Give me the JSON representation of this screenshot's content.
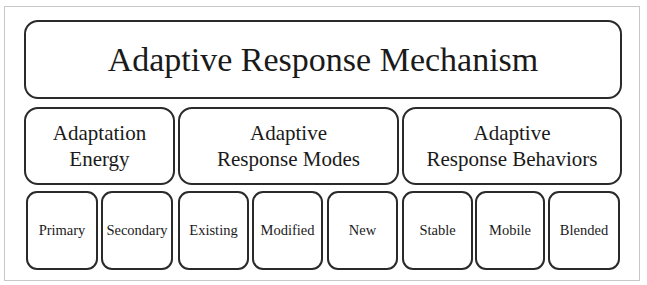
{
  "diagram": {
    "title": "Adaptive Response Mechanism",
    "categories": [
      {
        "label_line1": "Adaptation",
        "label_line2": "Energy",
        "children": [
          "Primary",
          "Secondary"
        ]
      },
      {
        "label_line1": "Adaptive",
        "label_line2": "Response Modes",
        "children": [
          "Existing",
          "Modified",
          "New"
        ]
      },
      {
        "label_line1": "Adaptive",
        "label_line2": "Response Behaviors",
        "children": [
          "Stable",
          "Mobile",
          "Blended"
        ]
      }
    ],
    "colors": {
      "border": "#2a2a2a",
      "frame": "#c8c8c8",
      "background": "#ffffff",
      "text": "#1a1a1a"
    }
  }
}
